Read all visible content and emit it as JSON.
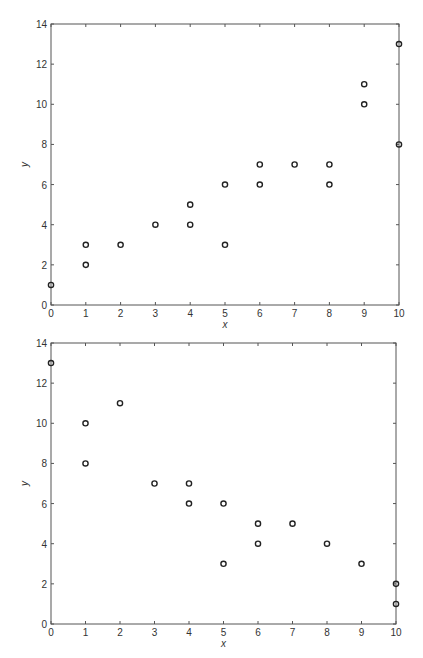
{
  "chart_data": [
    {
      "type": "scatter",
      "title": "",
      "xlabel": "x",
      "ylabel": "y",
      "xlim": [
        0,
        10
      ],
      "ylim": [
        0,
        14
      ],
      "xticks": [
        0,
        1,
        2,
        3,
        4,
        5,
        6,
        7,
        8,
        9,
        10
      ],
      "yticks": [
        0,
        2,
        4,
        6,
        8,
        10,
        12,
        14
      ],
      "grid": false,
      "legend": null,
      "marker": "open-circle",
      "series": [
        {
          "name": "points",
          "x": [
            0,
            1,
            1,
            2,
            3,
            4,
            4,
            5,
            5,
            6,
            6,
            7,
            8,
            8,
            9,
            9,
            10,
            10
          ],
          "y": [
            1,
            2,
            3,
            3,
            4,
            4,
            5,
            3,
            6,
            6,
            7,
            7,
            6,
            7,
            10,
            11,
            8,
            13
          ]
        }
      ]
    },
    {
      "type": "scatter",
      "title": "",
      "xlabel": "x",
      "ylabel": "y",
      "xlim": [
        0,
        10
      ],
      "ylim": [
        0,
        14
      ],
      "xticks": [
        0,
        1,
        2,
        3,
        4,
        5,
        6,
        7,
        8,
        9,
        10
      ],
      "yticks": [
        0,
        2,
        4,
        6,
        8,
        10,
        12,
        14
      ],
      "grid": false,
      "legend": null,
      "marker": "open-circle",
      "series": [
        {
          "name": "points",
          "x": [
            0,
            1,
            1,
            2,
            3,
            4,
            4,
            5,
            5,
            6,
            6,
            7,
            8,
            9,
            10,
            10
          ],
          "y": [
            13,
            8,
            10,
            11,
            7,
            6,
            7,
            3,
            6,
            4,
            5,
            5,
            4,
            3,
            1,
            2
          ]
        }
      ]
    }
  ],
  "layout": {
    "plots": [
      {
        "left": 51,
        "top": 24,
        "right": 399,
        "bottom": 305
      },
      {
        "left": 51,
        "top": 343,
        "right": 396,
        "bottom": 624
      }
    ],
    "colors": {
      "axis": "#555555",
      "marker": "#222222",
      "text": "#333333"
    }
  }
}
